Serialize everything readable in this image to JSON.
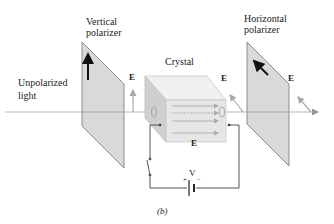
{
  "labels": {
    "vertical_polarizer_line1": "Vertical",
    "vertical_polarizer_line2": "polarizer",
    "horizontal_polarizer_line1": "Horizontal",
    "horizontal_polarizer_line2": "polarizer",
    "unpolarized_line1": "Unpolarized",
    "unpolarized_line2": "light",
    "crystal": "Crystal",
    "field_e1": "E",
    "field_e2": "E",
    "field_e3": "E",
    "field_e_crystal": "E",
    "voltage": "V",
    "plus": "+",
    "minus": "−",
    "caption": "(b)"
  },
  "colors": {
    "polarizer_fill": "#d9d9d9",
    "polarizer_edge": "#8c8c8c",
    "crystal_front": "#e6e6e6",
    "crystal_top": "#f0f0f0",
    "crystal_side": "#cfcfcf",
    "ray": "#b5b5b5",
    "wire": "#555555",
    "arrow": "#111111"
  }
}
